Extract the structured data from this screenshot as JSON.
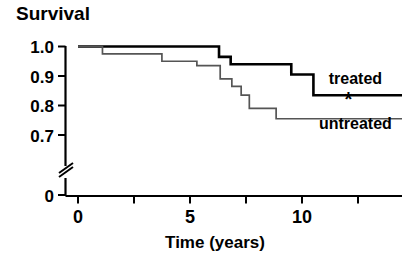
{
  "chart_data": {
    "type": "line",
    "subtype": "kaplan-meier-step",
    "title": "",
    "ylabel": "Survival",
    "xlabel": "Time (years)",
    "xlim": [
      0,
      13.9
    ],
    "ylim": [
      0.65,
      1.0
    ],
    "y_axis_break": true,
    "y_axis_break_label": "0",
    "grid": false,
    "legend_position": "inline-right",
    "xticks": [
      0,
      2.5,
      5,
      7.5,
      10,
      12.5
    ],
    "xtick_labels": [
      "0",
      "",
      "5",
      "",
      "10",
      ""
    ],
    "yticks": [
      0.7,
      0.8,
      0.9,
      1.0
    ],
    "ytick_labels": [
      "0.7",
      "0.8",
      "0.9",
      "1.0"
    ],
    "annotations": [
      {
        "text": "*",
        "x": 11.6,
        "y": 0.797,
        "name": "significance-star"
      }
    ],
    "series": [
      {
        "name": "treated",
        "label": "treated",
        "color": "#000000",
        "line_width": 2.6,
        "label_x": 11.9,
        "label_y": 0.872,
        "steps": [
          {
            "t": 0.0,
            "s": 1.0
          },
          {
            "t": 6.05,
            "s": 1.0
          },
          {
            "t": 6.05,
            "s": 0.965
          },
          {
            "t": 6.55,
            "s": 0.965
          },
          {
            "t": 6.55,
            "s": 0.94
          },
          {
            "t": 9.15,
            "s": 0.94
          },
          {
            "t": 9.15,
            "s": 0.905
          },
          {
            "t": 10.1,
            "s": 0.905
          },
          {
            "t": 10.1,
            "s": 0.835
          },
          {
            "t": 13.9,
            "s": 0.835
          }
        ]
      },
      {
        "name": "untreated",
        "label": "untreated",
        "color": "#555555",
        "line_width": 1.7,
        "label_x": 11.9,
        "label_y": 0.722,
        "steps": [
          {
            "t": 0.0,
            "s": 1.0
          },
          {
            "t": 1.05,
            "s": 1.0
          },
          {
            "t": 1.05,
            "s": 0.975
          },
          {
            "t": 3.6,
            "s": 0.975
          },
          {
            "t": 3.6,
            "s": 0.95
          },
          {
            "t": 5.1,
            "s": 0.95
          },
          {
            "t": 5.1,
            "s": 0.935
          },
          {
            "t": 6.1,
            "s": 0.935
          },
          {
            "t": 6.1,
            "s": 0.89
          },
          {
            "t": 6.6,
            "s": 0.89
          },
          {
            "t": 6.6,
            "s": 0.865
          },
          {
            "t": 7.0,
            "s": 0.865
          },
          {
            "t": 7.0,
            "s": 0.835
          },
          {
            "t": 7.35,
            "s": 0.835
          },
          {
            "t": 7.35,
            "s": 0.79
          },
          {
            "t": 8.5,
            "s": 0.79
          },
          {
            "t": 8.5,
            "s": 0.755
          },
          {
            "t": 13.9,
            "s": 0.755
          }
        ]
      }
    ]
  }
}
